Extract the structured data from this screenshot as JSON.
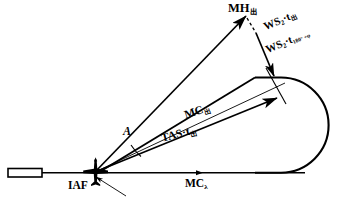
{
  "figure": {
    "type": "holding-pattern-entry-diagram",
    "background_color": "#ffffff",
    "line_color": "#000000"
  },
  "labels": {
    "mh_out": {
      "base": "MH",
      "subscript": "出"
    },
    "ws_t_out": {
      "base": "WS",
      "sub_num": "2",
      "operator": "·",
      "var": "t",
      "subscript": "出"
    },
    "ws_t_180": {
      "base": "WS",
      "sub_num": "2",
      "operator": "·",
      "var": "t",
      "subscript": "180° +φ"
    },
    "mc_out": {
      "base": "MC",
      "subscript": "出"
    },
    "tas_t_out": {
      "base": "TAS",
      "operator": "·",
      "var": "t",
      "subscript": "出"
    },
    "mc_lambda": {
      "base": "MC",
      "subscript": "λ"
    },
    "iaf": {
      "text": "IAF"
    },
    "angle": {
      "text": "A"
    }
  },
  "icons": {
    "aircraft": "aircraft-icon",
    "runway": "runway-icon",
    "arrowhead": "arrowhead-icon"
  }
}
